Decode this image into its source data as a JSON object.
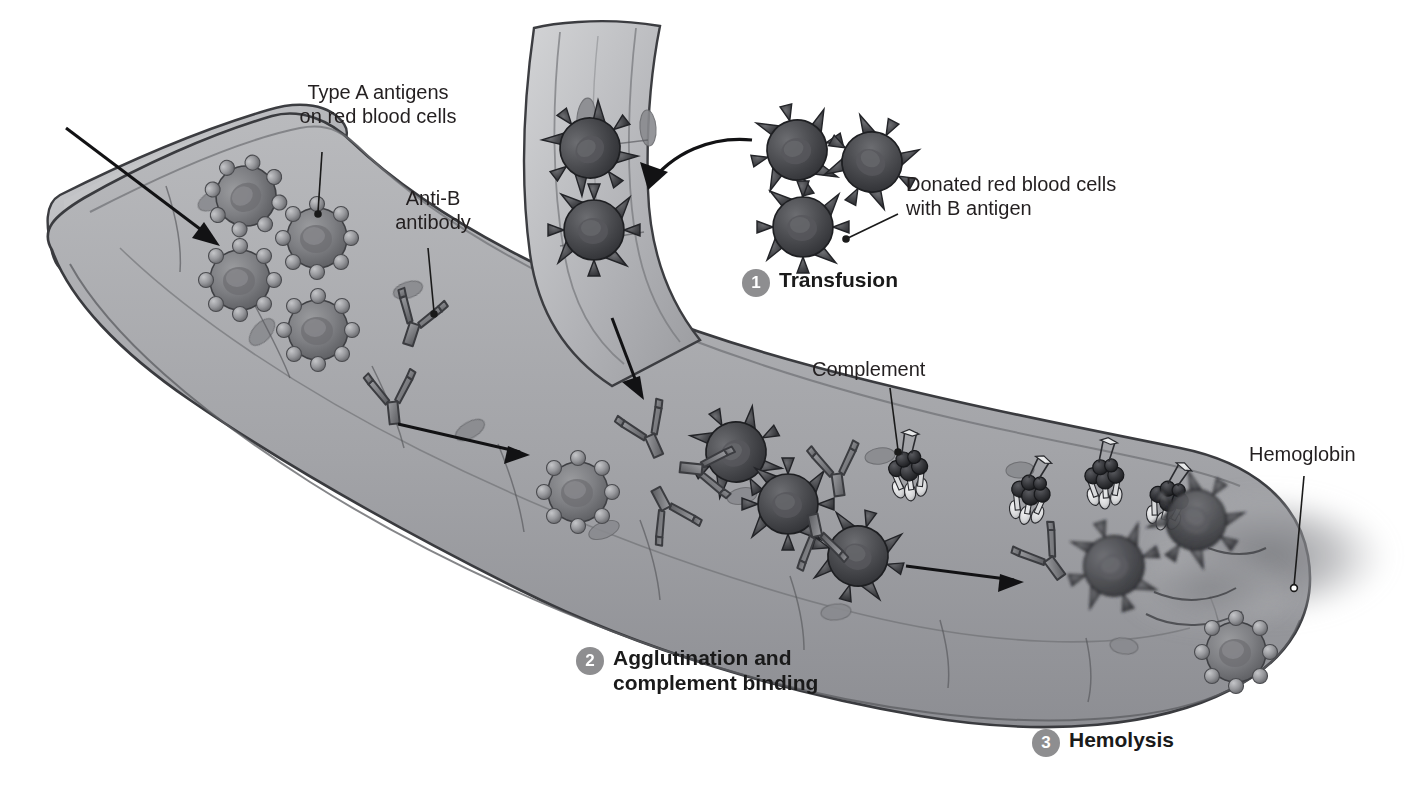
{
  "figure": {
    "background_color": "#ffffff",
    "ink_color": "#231f20",
    "badge_color": "#8e8e90",
    "badge_text_color": "#ffffff"
  },
  "labels": {
    "type_a_antigens": "Type A antigens\non red blood cells",
    "anti_b_antibody": "Anti-B\nantibody",
    "donated_cells": "Donated red blood cells\nwith B antigen",
    "complement": "Complement",
    "hemoglobin": "Hemoglobin"
  },
  "steps": [
    {
      "number": "1",
      "label": "Transfusion"
    },
    {
      "number": "2",
      "label": "Agglutination and\ncomplement binding"
    },
    {
      "number": "3",
      "label": "Hemolysis"
    }
  ],
  "illustration": {
    "vessel_name": "blood-vessel-lumen",
    "recipient_cells": {
      "name": "recipient-red-blood-cell-with-a-antigen",
      "antigen_shape": "sphere",
      "count": 12
    },
    "donated_cells": {
      "name": "donated-red-blood-cell-with-b-antigen",
      "antigen_shape": "spike",
      "count": 11
    },
    "antibodies": {
      "name": "anti-b-antibody",
      "shape": "Y",
      "count": 9
    },
    "complement_proteins": {
      "name": "complement-protein-complex",
      "shape": "dark-sphere-cluster-with-striped-tails",
      "count": 5
    },
    "hemoglobin_cloud": {
      "name": "released-hemoglobin-cloud"
    },
    "flow_arrows": 4,
    "transfusion_arrow": 1
  }
}
